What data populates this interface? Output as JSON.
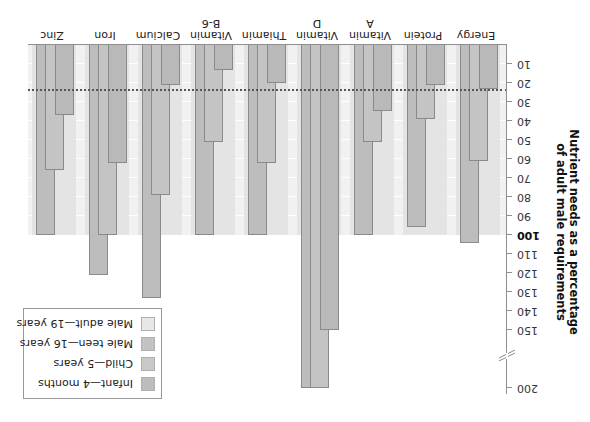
{
  "chart_data": {
    "type": "bar",
    "title": "",
    "ylabel": "Nutrient needs as a percentage of adult male requirements",
    "ylabel_lines": [
      "Nutrient needs as a percentage",
      "of adult male requirements"
    ],
    "xlabel": "",
    "orientation_note": "figure rendered rotated 180 degrees",
    "categories": [
      "Energy",
      "Protein",
      "Vitamin A",
      "Vitamin D",
      "Thiamin",
      "Vitamin B-6",
      "Calcium",
      "Iron",
      "Zinc"
    ],
    "category_lines": [
      [
        "Energy"
      ],
      [
        "Protein"
      ],
      [
        "Vitamin",
        "A"
      ],
      [
        "Vitamin",
        "D"
      ],
      [
        "Thiamin"
      ],
      [
        "Vitamin",
        "B-6"
      ],
      [
        "Calcium"
      ],
      [
        "Iron"
      ],
      [
        "Zinc"
      ]
    ],
    "series": [
      {
        "name": "Infant—4 months",
        "color": "#b9b9b9",
        "values": [
          23,
          21,
          35,
          150,
          20,
          13,
          21,
          62,
          37
        ]
      },
      {
        "name": "Child—5 years",
        "color": "#c4c4c4",
        "values": [
          61,
          39,
          51,
          200,
          62,
          51,
          79,
          100,
          66
        ]
      },
      {
        "name": "Male teen—16 years",
        "color": "#bdbdbd",
        "values": [
          104,
          96,
          100,
          200,
          100,
          100,
          133,
          121,
          100
        ]
      },
      {
        "name": "Male adult—19 years",
        "color": "#e4e4e4",
        "values": [
          100,
          100,
          100,
          100,
          100,
          100,
          100,
          100,
          100
        ]
      }
    ],
    "yticks": [
      10,
      20,
      30,
      40,
      50,
      60,
      70,
      80,
      90,
      100,
      110,
      120,
      130,
      140,
      150,
      200
    ],
    "ylim": [
      0,
      200
    ],
    "axis_break": [
      150,
      200
    ],
    "reference_line": {
      "value": 24,
      "style": "dotted"
    },
    "grid": true,
    "legend_position": "upper right (of upright chart)"
  },
  "legend": {
    "items": [
      {
        "label": "Infant—4 months",
        "color": "#bdbdbd"
      },
      {
        "label": "Child—5 years",
        "color": "#c9c9c9"
      },
      {
        "label": "Male teen—16 years",
        "color": "#c2c2c2"
      },
      {
        "label": "Male adult—19 years",
        "color": "#e6e6e6"
      }
    ]
  }
}
